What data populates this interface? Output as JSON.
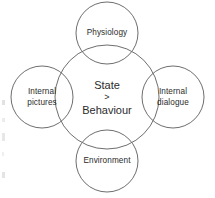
{
  "diagram": {
    "type": "radial-node-diagram",
    "canvas": {
      "width": 215,
      "height": 198
    },
    "background_color": "#ffffff",
    "stroke_color": "#6e6e6e",
    "text_color": "#2b2b2b",
    "center": {
      "name": "state-behaviour",
      "lines": [
        "State",
        ">",
        "Behaviour"
      ],
      "line_1": "State",
      "line_2": ">",
      "line_3": "Behaviour",
      "cx": 107,
      "cy": 97,
      "r": 52
    },
    "nodes": [
      {
        "id": "physiology",
        "label": "Physiology",
        "position": "top",
        "cx": 107,
        "cy": 33,
        "r": 31
      },
      {
        "id": "internal-dialogue",
        "label": "Internal\ndialogue",
        "position": "right",
        "cx": 173,
        "cy": 97,
        "r": 31
      },
      {
        "id": "environment",
        "label": "Environment",
        "position": "bottom",
        "cx": 107,
        "cy": 161,
        "r": 31
      },
      {
        "id": "internal-pictures",
        "label": "Internal\npictures",
        "position": "left",
        "cx": 42,
        "cy": 97,
        "r": 31
      }
    ]
  }
}
